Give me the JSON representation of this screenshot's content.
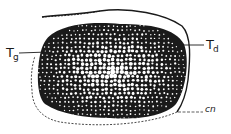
{
  "figure": {
    "labels": {
      "tg": {
        "main": "T",
        "sub": "g"
      },
      "td": {
        "main": "T",
        "sub": "d"
      },
      "cn": "cn"
    },
    "colors": {
      "ink": "#1a1a1a",
      "background": "#ffffff"
    }
  }
}
